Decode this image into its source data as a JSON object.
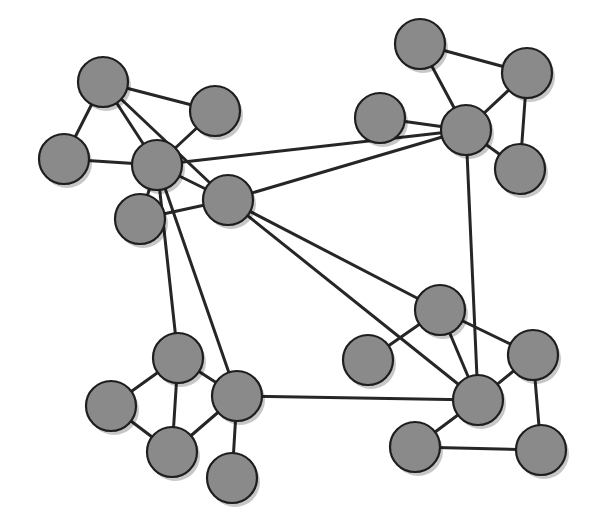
{
  "figure": {
    "background_color": "#ffffff",
    "width": 596,
    "height": 529
  },
  "style": {
    "node_fill": "#8a8a8a",
    "node_stroke": "#1e1e1e",
    "node_stroke_width": 2.2,
    "node_radius": 25,
    "edge_color": "#262626",
    "edge_width": 3.0,
    "shadow_color": "#00000038",
    "shadow_offset_x": 3,
    "shadow_offset_y": 4
  },
  "graph_data": {
    "type": "node-link-graph",
    "directed": false,
    "node_count": 21,
    "edge_count": 33,
    "clusters": [
      {
        "id": "top-left",
        "label": "Top left cluster",
        "nodes": [
          "n1",
          "n2",
          "n3",
          "n4",
          "n5",
          "n6"
        ]
      },
      {
        "id": "top-right",
        "label": "Top right cluster",
        "nodes": [
          "n7",
          "n8",
          "n9",
          "n10",
          "n11"
        ]
      },
      {
        "id": "bottom-left",
        "label": "Bottom left cluster",
        "nodes": [
          "n12",
          "n13",
          "n14",
          "n15",
          "n16"
        ]
      },
      {
        "id": "bottom-right",
        "label": "Bottom right cluster",
        "nodes": [
          "n17",
          "n18",
          "n19",
          "n20",
          "n21"
        ]
      }
    ],
    "nodes": [
      {
        "id": "n1",
        "label": "",
        "x": 103,
        "y": 82,
        "r": 25,
        "cluster": "top-left"
      },
      {
        "id": "n2",
        "label": "",
        "x": 215,
        "y": 111,
        "r": 25,
        "cluster": "top-left"
      },
      {
        "id": "n3",
        "label": "",
        "x": 64,
        "y": 159,
        "r": 25,
        "cluster": "top-left"
      },
      {
        "id": "n4",
        "label": "",
        "x": 157,
        "y": 165,
        "r": 25,
        "cluster": "top-left"
      },
      {
        "id": "n5",
        "label": "",
        "x": 140,
        "y": 219,
        "r": 25,
        "cluster": "top-left"
      },
      {
        "id": "n6",
        "label": "",
        "x": 228,
        "y": 200,
        "r": 25,
        "cluster": "top-left"
      },
      {
        "id": "n7",
        "label": "",
        "x": 420,
        "y": 44,
        "r": 25,
        "cluster": "top-right"
      },
      {
        "id": "n8",
        "label": "",
        "x": 527,
        "y": 73,
        "r": 25,
        "cluster": "top-right"
      },
      {
        "id": "n9",
        "label": "",
        "x": 380,
        "y": 118,
        "r": 25,
        "cluster": "top-right"
      },
      {
        "id": "n10",
        "label": "",
        "x": 466,
        "y": 130,
        "r": 25,
        "cluster": "top-right"
      },
      {
        "id": "n11",
        "label": "",
        "x": 520,
        "y": 169,
        "r": 25,
        "cluster": "top-right"
      },
      {
        "id": "n12",
        "label": "",
        "x": 178,
        "y": 358,
        "r": 25,
        "cluster": "bottom-left"
      },
      {
        "id": "n13",
        "label": "",
        "x": 111,
        "y": 406,
        "r": 25,
        "cluster": "bottom-left"
      },
      {
        "id": "n14",
        "label": "",
        "x": 237,
        "y": 396,
        "r": 25,
        "cluster": "bottom-left"
      },
      {
        "id": "n15",
        "label": "",
        "x": 172,
        "y": 452,
        "r": 25,
        "cluster": "bottom-left"
      },
      {
        "id": "n16",
        "label": "",
        "x": 232,
        "y": 478,
        "r": 25,
        "cluster": "bottom-left"
      },
      {
        "id": "n17",
        "label": "",
        "x": 440,
        "y": 310,
        "r": 25,
        "cluster": "bottom-right"
      },
      {
        "id": "n18",
        "label": "",
        "x": 368,
        "y": 360,
        "r": 25,
        "cluster": "bottom-right"
      },
      {
        "id": "n19",
        "label": "",
        "x": 533,
        "y": 355,
        "r": 25,
        "cluster": "bottom-right"
      },
      {
        "id": "n20",
        "label": "",
        "x": 478,
        "y": 400,
        "r": 25,
        "cluster": "bottom-right"
      },
      {
        "id": "n21",
        "label": "",
        "x": 415,
        "y": 447,
        "r": 25,
        "cluster": "bottom-right"
      },
      {
        "id": "n22",
        "label": "",
        "x": 541,
        "y": 450,
        "r": 25,
        "cluster": "bottom-right"
      }
    ],
    "edges": [
      {
        "source": "n1",
        "target": "n2"
      },
      {
        "source": "n1",
        "target": "n3"
      },
      {
        "source": "n1",
        "target": "n4"
      },
      {
        "source": "n1",
        "target": "n6"
      },
      {
        "source": "n2",
        "target": "n4"
      },
      {
        "source": "n3",
        "target": "n4"
      },
      {
        "source": "n4",
        "target": "n5"
      },
      {
        "source": "n4",
        "target": "n6"
      },
      {
        "source": "n4",
        "target": "n10"
      },
      {
        "source": "n4",
        "target": "n12"
      },
      {
        "source": "n4",
        "target": "n14"
      },
      {
        "source": "n5",
        "target": "n6"
      },
      {
        "source": "n6",
        "target": "n10"
      },
      {
        "source": "n6",
        "target": "n17"
      },
      {
        "source": "n6",
        "target": "n20"
      },
      {
        "source": "n7",
        "target": "n8"
      },
      {
        "source": "n7",
        "target": "n10"
      },
      {
        "source": "n8",
        "target": "n10"
      },
      {
        "source": "n8",
        "target": "n11"
      },
      {
        "source": "n9",
        "target": "n10"
      },
      {
        "source": "n10",
        "target": "n11"
      },
      {
        "source": "n10",
        "target": "n20"
      },
      {
        "source": "n12",
        "target": "n13"
      },
      {
        "source": "n12",
        "target": "n14"
      },
      {
        "source": "n12",
        "target": "n15"
      },
      {
        "source": "n13",
        "target": "n15"
      },
      {
        "source": "n14",
        "target": "n15"
      },
      {
        "source": "n14",
        "target": "n16"
      },
      {
        "source": "n14",
        "target": "n20"
      },
      {
        "source": "n17",
        "target": "n18"
      },
      {
        "source": "n17",
        "target": "n19"
      },
      {
        "source": "n17",
        "target": "n20"
      },
      {
        "source": "n19",
        "target": "n20"
      },
      {
        "source": "n19",
        "target": "n22"
      },
      {
        "source": "n20",
        "target": "n21"
      },
      {
        "source": "n21",
        "target": "n22"
      }
    ]
  }
}
